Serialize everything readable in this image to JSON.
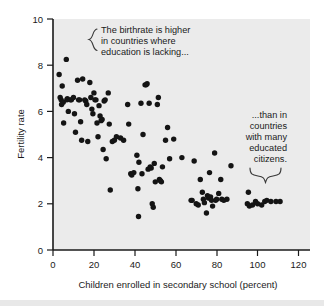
{
  "figure": {
    "background_color": "#ffffff",
    "plot_background_color": "#ebebeb",
    "dot_color": "#141414",
    "axis_color": "#1a1a1a"
  },
  "chart_data": {
    "type": "scatter",
    "title": "",
    "xlabel": "Children enrolled in secondary school (percent)",
    "ylabel": "Fertility rate",
    "xlim": [
      0,
      125
    ],
    "ylim": [
      0,
      10
    ],
    "xticks": [
      0,
      20,
      40,
      60,
      80,
      100,
      120
    ],
    "yticks": [
      0,
      2,
      4,
      6,
      8,
      10
    ],
    "xtick_labels": [
      "0",
      "20",
      "40",
      "60",
      "80",
      "100",
      "120"
    ],
    "ytick_labels": [
      "0",
      "2",
      "4",
      "6",
      "8",
      "10"
    ],
    "grid": false,
    "legend": false,
    "series": [
      {
        "name": "countries",
        "points": [
          [
            3.0,
            7.6
          ],
          [
            3.5,
            6.6
          ],
          [
            4.0,
            6.5
          ],
          [
            4.2,
            6.3
          ],
          [
            4.5,
            7.1
          ],
          [
            5.0,
            6.4
          ],
          [
            5.2,
            5.5
          ],
          [
            6.5,
            8.25
          ],
          [
            6.8,
            6.5
          ],
          [
            7.0,
            6.55
          ],
          [
            7.5,
            6.0
          ],
          [
            8.5,
            6.5
          ],
          [
            9.0,
            6.5
          ],
          [
            10.0,
            6.6
          ],
          [
            10.5,
            5.9
          ],
          [
            11.0,
            5.1
          ],
          [
            12.0,
            7.35
          ],
          [
            12.5,
            6.5
          ],
          [
            13.0,
            6.5
          ],
          [
            13.5,
            5.55
          ],
          [
            14.0,
            4.75
          ],
          [
            14.5,
            7.4
          ],
          [
            15.5,
            6.5
          ],
          [
            16.0,
            6.45
          ],
          [
            16.5,
            6.3
          ],
          [
            17.0,
            4.7
          ],
          [
            18.0,
            7.25
          ],
          [
            18.5,
            6.6
          ],
          [
            19.0,
            6.1
          ],
          [
            19.5,
            5.9
          ],
          [
            20.0,
            6.8
          ],
          [
            20.5,
            6.5
          ],
          [
            21.0,
            6.5
          ],
          [
            21.5,
            5.5
          ],
          [
            22.0,
            4.9
          ],
          [
            22.5,
            6.25
          ],
          [
            23.0,
            5.8
          ],
          [
            23.5,
            5.6
          ],
          [
            24.0,
            5.65
          ],
          [
            24.5,
            4.35
          ],
          [
            25.0,
            6.45
          ],
          [
            25.5,
            6.5
          ],
          [
            26.0,
            3.95
          ],
          [
            27.0,
            6.8
          ],
          [
            27.5,
            5.45
          ],
          [
            28.0,
            2.6
          ],
          [
            29.0,
            4.7
          ],
          [
            30.0,
            4.75
          ],
          [
            31.0,
            4.9
          ],
          [
            33.0,
            4.85
          ],
          [
            34.5,
            4.75
          ],
          [
            36.5,
            6.3
          ],
          [
            37.0,
            5.45
          ],
          [
            38.0,
            3.3
          ],
          [
            38.5,
            3.25
          ],
          [
            39.5,
            3.35
          ],
          [
            41.0,
            4.1
          ],
          [
            41.5,
            2.65
          ],
          [
            41.8,
            1.45
          ],
          [
            42.0,
            3.8
          ],
          [
            43.0,
            6.35
          ],
          [
            43.5,
            3.3
          ],
          [
            44.0,
            5.0
          ],
          [
            45.0,
            7.15
          ],
          [
            45.5,
            7.15
          ],
          [
            46.0,
            7.2
          ],
          [
            46.5,
            3.5
          ],
          [
            47.0,
            6.35
          ],
          [
            47.5,
            3.6
          ],
          [
            48.0,
            3.55
          ],
          [
            48.5,
            2.0
          ],
          [
            49.0,
            1.85
          ],
          [
            49.5,
            3.75
          ],
          [
            50.0,
            2.95
          ],
          [
            51.0,
            6.3
          ],
          [
            51.5,
            6.6
          ],
          [
            52.0,
            3.05
          ],
          [
            52.5,
            3.0
          ],
          [
            53.0,
            2.95
          ],
          [
            53.5,
            3.6
          ],
          [
            55.0,
            4.75
          ],
          [
            56.0,
            5.3
          ],
          [
            57.0,
            3.95
          ],
          [
            59.0,
            4.8
          ],
          [
            63.0,
            4.0
          ],
          [
            67.5,
            2.15
          ],
          [
            68.0,
            2.15
          ],
          [
            69.0,
            3.85
          ],
          [
            70.0,
            2.0
          ],
          [
            71.0,
            1.95
          ],
          [
            72.0,
            3.05
          ],
          [
            73.0,
            2.5
          ],
          [
            73.5,
            2.2
          ],
          [
            74.0,
            2.05
          ],
          [
            75.0,
            1.6
          ],
          [
            75.5,
            2.35
          ],
          [
            76.0,
            2.25
          ],
          [
            76.5,
            3.35
          ],
          [
            77.0,
            2.3
          ],
          [
            77.5,
            2.15
          ],
          [
            78.0,
            1.9
          ],
          [
            79.0,
            4.2
          ],
          [
            79.5,
            2.15
          ],
          [
            80.0,
            2.2
          ],
          [
            81.0,
            2.45
          ],
          [
            82.0,
            3.05
          ],
          [
            82.5,
            2.2
          ],
          [
            83.5,
            2.15
          ],
          [
            85.0,
            2.2
          ],
          [
            87.0,
            3.65
          ],
          [
            95.0,
            2.0
          ],
          [
            95.5,
            2.5
          ],
          [
            96.0,
            1.9
          ],
          [
            97.5,
            1.95
          ],
          [
            99.0,
            2.1
          ],
          [
            100.0,
            2.0
          ],
          [
            102.0,
            1.95
          ],
          [
            103.5,
            2.1
          ],
          [
            104.5,
            2.15
          ],
          [
            106.5,
            2.1
          ],
          [
            109.0,
            2.1
          ],
          [
            111.0,
            2.1
          ]
        ]
      }
    ],
    "annotations": [
      {
        "id": "annotation-left",
        "lines": [
          "The birthrate is higher",
          "in countries where",
          "education is lacking..."
        ],
        "brace": "left-curly"
      },
      {
        "id": "annotation-right",
        "lines": [
          "...than in",
          "countries",
          "with many",
          "educated",
          "citizens."
        ],
        "brace": "bottom-curly"
      }
    ]
  }
}
